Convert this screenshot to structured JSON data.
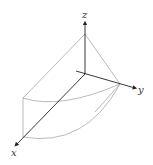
{
  "diagram": {
    "type": "3d-solid-region",
    "axes": {
      "x_label": "x",
      "y_label": "y",
      "z_label": "z"
    },
    "colors": {
      "axis": "#222222",
      "edge": "#a0a0a0",
      "label": "#333333",
      "background": "#ffffff"
    }
  }
}
